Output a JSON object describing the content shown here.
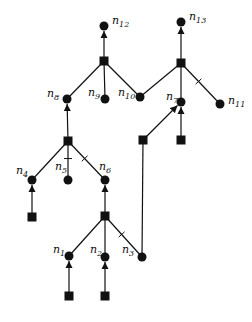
{
  "colors": {
    "ink": "#111111",
    "background": "#ffffff"
  },
  "nodes": [
    {
      "id": "n12",
      "kind": "circle",
      "x": 104,
      "y": 26,
      "label": "n",
      "sub": "12",
      "lx": 112,
      "ly": 24
    },
    {
      "id": "n13",
      "kind": "circle",
      "x": 181,
      "y": 22,
      "label": "n",
      "sub": "13",
      "lx": 189,
      "ly": 20
    },
    {
      "id": "s1",
      "kind": "square",
      "x": 104,
      "y": 61
    },
    {
      "id": "s2",
      "kind": "square",
      "x": 181,
      "y": 63
    },
    {
      "id": "n8",
      "kind": "circle",
      "x": 67,
      "y": 99,
      "label": "n",
      "sub": "8",
      "lx": 47,
      "ly": 97
    },
    {
      "id": "n9",
      "kind": "circle",
      "x": 105,
      "y": 99,
      "label": "n",
      "sub": "9",
      "lx": 88,
      "ly": 96
    },
    {
      "id": "n10",
      "kind": "circle",
      "x": 140,
      "y": 97,
      "label": "n",
      "sub": "10",
      "lx": 118,
      "ly": 96
    },
    {
      "id": "n7",
      "kind": "circle",
      "x": 181,
      "y": 102,
      "label": "n",
      "sub": "7",
      "lx": 166,
      "ly": 100
    },
    {
      "id": "n11",
      "kind": "circle",
      "x": 220,
      "y": 104,
      "label": "n",
      "sub": "11",
      "lx": 228,
      "ly": 104
    },
    {
      "id": "s3",
      "kind": "square",
      "x": 68,
      "y": 141
    },
    {
      "id": "s5",
      "kind": "square",
      "x": 143,
      "y": 140
    },
    {
      "id": "s6",
      "kind": "square",
      "x": 181,
      "y": 140
    },
    {
      "id": "n4",
      "kind": "circle",
      "x": 32,
      "y": 180,
      "label": "n",
      "sub": "4",
      "lx": 16,
      "ly": 174
    },
    {
      "id": "n5",
      "kind": "circle",
      "x": 68,
      "y": 180,
      "label": "n",
      "sub": "5",
      "lx": 55,
      "ly": 170
    },
    {
      "id": "n6",
      "kind": "circle",
      "x": 105,
      "y": 180,
      "label": "n",
      "sub": "6",
      "lx": 99,
      "ly": 170
    },
    {
      "id": "s7",
      "kind": "square",
      "x": 32,
      "y": 217
    },
    {
      "id": "s4",
      "kind": "square",
      "x": 105,
      "y": 216
    },
    {
      "id": "n1",
      "kind": "circle",
      "x": 69,
      "y": 256,
      "label": "n",
      "sub": "1",
      "lx": 53,
      "ly": 253
    },
    {
      "id": "n2",
      "kind": "circle",
      "x": 105,
      "y": 257,
      "label": "n",
      "sub": "2",
      "lx": 90,
      "ly": 253
    },
    {
      "id": "n3",
      "kind": "circle",
      "x": 142,
      "y": 257,
      "label": "n",
      "sub": "3",
      "lx": 122,
      "ly": 253
    },
    {
      "id": "s8",
      "kind": "square",
      "x": 69,
      "y": 296
    },
    {
      "id": "s9",
      "kind": "square",
      "x": 105,
      "y": 296
    }
  ],
  "edges": [
    {
      "from": "s1",
      "to": "n12",
      "arrow": true
    },
    {
      "from": "s2",
      "to": "n13",
      "arrow": true
    },
    {
      "from": "s1",
      "to": "n8"
    },
    {
      "from": "s1",
      "to": "n9"
    },
    {
      "from": "s1",
      "to": "n10"
    },
    {
      "from": "s2",
      "to": "n10"
    },
    {
      "from": "s2",
      "to": "n7"
    },
    {
      "from": "s2",
      "to": "n11",
      "tick": true
    },
    {
      "from": "s3",
      "to": "n8",
      "arrow": true
    },
    {
      "from": "s5",
      "to": "n7",
      "arrow": true
    },
    {
      "from": "s6",
      "to": "n7",
      "arrow": true
    },
    {
      "from": "s3",
      "to": "n4"
    },
    {
      "from": "s3",
      "to": "n5",
      "tick": true
    },
    {
      "from": "s3",
      "to": "n6",
      "tick": true
    },
    {
      "from": "s7",
      "to": "n4",
      "arrow": true
    },
    {
      "from": "s4",
      "to": "n6",
      "arrow": true
    },
    {
      "from": "s5",
      "to": "n3"
    },
    {
      "from": "s4",
      "to": "n1"
    },
    {
      "from": "s4",
      "to": "n2"
    },
    {
      "from": "s4",
      "to": "n3",
      "tick": true
    },
    {
      "from": "s8",
      "to": "n1",
      "arrow": true
    },
    {
      "from": "s9",
      "to": "n2",
      "arrow": true
    }
  ]
}
